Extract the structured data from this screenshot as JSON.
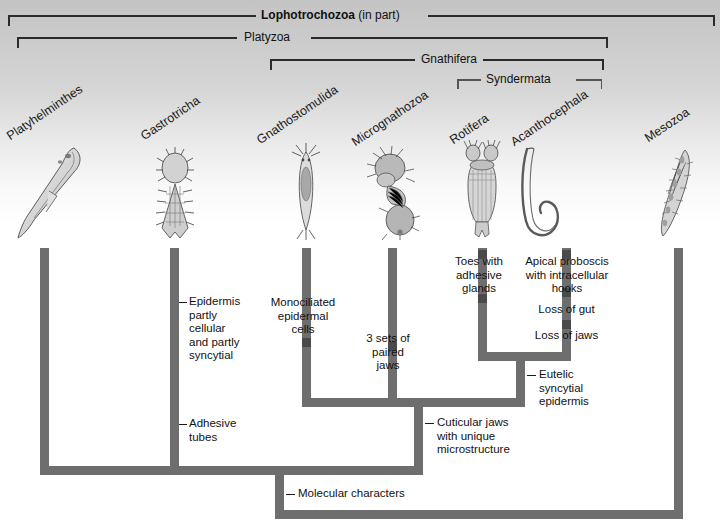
{
  "figure": {
    "type": "cladogram"
  },
  "clades": [
    {
      "name": "Lophotrochozoa",
      "suffix": " (in part)",
      "bold": true
    },
    {
      "name": "Platyzoa",
      "suffix": "",
      "bold": false
    },
    {
      "name": "Gnathifera",
      "suffix": "",
      "bold": false
    },
    {
      "name": "Syndermata",
      "suffix": "",
      "bold": false
    }
  ],
  "taxa": [
    {
      "label": "Platyhelminthes"
    },
    {
      "label": "Gastrotricha"
    },
    {
      "label": "Gnathostomulida"
    },
    {
      "label": "Micrognathozoa"
    },
    {
      "label": "Rotifera"
    },
    {
      "label": "Acanthocephala"
    },
    {
      "label": "Mesozoa"
    }
  ],
  "characters": [
    {
      "id": "epidermis",
      "text": "Epidermis\npartly\ncellular\nand partly\nsyncytial"
    },
    {
      "id": "adhesive-tubes",
      "text": "Adhesive\ntubes"
    },
    {
      "id": "monociliated",
      "text": "Monociliated\nepidermal\ncells"
    },
    {
      "id": "three-sets-jaws",
      "text": "3 sets of\npaired\njaws"
    },
    {
      "id": "toes",
      "text": "Toes with\nadhesive\nglands"
    },
    {
      "id": "apical-proboscis",
      "text": "Apical proboscis\nwith intracellular\nhooks"
    },
    {
      "id": "loss-of-gut",
      "text": "Loss of gut"
    },
    {
      "id": "loss-of-jaws",
      "text": "Loss of jaws"
    },
    {
      "id": "eutelic",
      "text": "Eutelic\nsyncytial\nepidermis"
    },
    {
      "id": "cuticular-jaws",
      "text": "Cuticular jaws\nwith unique\nmicrostructure"
    },
    {
      "id": "molecular",
      "text": "Molecular characters"
    }
  ],
  "colors": {
    "branch": "#6e6e6e",
    "tick": "#4a4a4a",
    "bracket": "#2b2b2b",
    "text": "#111111",
    "background_top": "#c4c4c4",
    "background_bottom": "#ffffff"
  }
}
